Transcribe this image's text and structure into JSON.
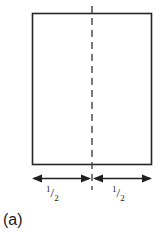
{
  "figure": {
    "caption": "(a)",
    "colors": {
      "background": "#ffffff",
      "stroke": "#262626",
      "dashed_stroke": "#4d4d4d",
      "text": "#1a1a1a"
    },
    "shape": {
      "name": "rectangle",
      "outline_style": "solid",
      "x": 32,
      "y": 13,
      "width": 120,
      "height": 152
    },
    "center_line": {
      "name": "vertical-dashed-center-line",
      "style": "dashed",
      "x": 92,
      "y_top": 6,
      "y_bottom": 190
    },
    "dimensions": [
      {
        "id": "left",
        "label_numerator": "1",
        "label_slash": "/",
        "label_denominator": "2",
        "label_text": "1/2",
        "arrow_style": "double-headed",
        "x_start": 32,
        "x_end": 91,
        "y": 178
      },
      {
        "id": "right",
        "label_numerator": "1",
        "label_slash": "/",
        "label_denominator": "2",
        "label_text": "1/2",
        "arrow_style": "double-headed",
        "x_start": 93,
        "x_end": 152,
        "y": 178
      }
    ]
  }
}
